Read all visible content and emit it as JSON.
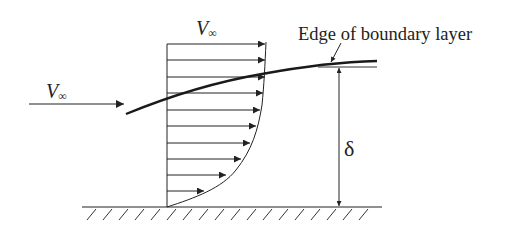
{
  "diagram": {
    "labels": {
      "freestream_left": {
        "main": "V",
        "sub": "∞"
      },
      "freestream_top": {
        "main": "V",
        "sub": "∞"
      },
      "edge": "Edge of boundary layer",
      "thickness": "δ"
    },
    "colors": {
      "ink": "#222222",
      "background": "#ffffff"
    },
    "geometry": {
      "wall_x": 167,
      "ground_y": 207,
      "ground_x_start": 82,
      "ground_x_end": 382,
      "hatch_spacing": 16,
      "delta_arrow_x": 339,
      "delta_top_y": 67,
      "thin_edge_line": {
        "x1": 318,
        "x2": 377,
        "y": 67
      }
    },
    "profile_arrows": [
      {
        "y": 44,
        "tip_x": 265
      },
      {
        "y": 60,
        "tip_x": 265
      },
      {
        "y": 77,
        "tip_x": 265
      },
      {
        "y": 93,
        "tip_x": 263
      },
      {
        "y": 110,
        "tip_x": 260
      },
      {
        "y": 126,
        "tip_x": 256
      },
      {
        "y": 143,
        "tip_x": 250
      },
      {
        "y": 159,
        "tip_x": 241
      },
      {
        "y": 175,
        "tip_x": 226
      },
      {
        "y": 191,
        "tip_x": 204
      }
    ],
    "freestream_arrow": {
      "x1": 29,
      "x2": 124,
      "y": 104
    }
  }
}
